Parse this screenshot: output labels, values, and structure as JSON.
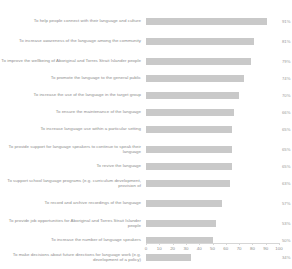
{
  "chart_data": {
    "type": "bar",
    "orientation": "horizontal",
    "title": "",
    "xlabel": "",
    "ylabel": "",
    "xlim": [
      0,
      100
    ],
    "xticks": [
      "0",
      "10",
      "20",
      "30",
      "40",
      "50",
      "60",
      "70",
      "80",
      "90",
      "100"
    ],
    "grid": false,
    "legend": "none",
    "bar_color": "#c9c9c9",
    "value_suffix": "%",
    "categories": [
      "To help people connect with their language and culture",
      "To increase awareness of the language among the community",
      "To improve the wellbeing of Aboriginal and Torres Strait Islander people",
      "To promote the language to the general public",
      "To increase the use of the language in the target group",
      "To ensure the maintenance of the language",
      "To increase language use within a particular setting",
      "To provide support for language speakers to continue to speak their language",
      "To revive the language",
      "To support school language programs (e.g. curriculum development, provision of",
      "To record and archive recordings of the language",
      "To provide job opportunities for Aboriginal and Torres Strait Islander people",
      "To increase the number of language speakers",
      "To make decisions about future directions for language work (e.g. development of a policy)"
    ],
    "values": [
      91,
      81,
      79,
      74,
      70,
      66,
      65,
      65,
      65,
      63,
      57,
      53,
      50,
      34
    ],
    "value_labels": [
      "91%",
      "81%",
      "79%",
      "74%",
      "70%",
      "66%",
      "65%",
      "65%",
      "65%",
      "63%",
      "57%",
      "53%",
      "50%",
      "34%"
    ]
  },
  "axis": {
    "caption": ""
  }
}
